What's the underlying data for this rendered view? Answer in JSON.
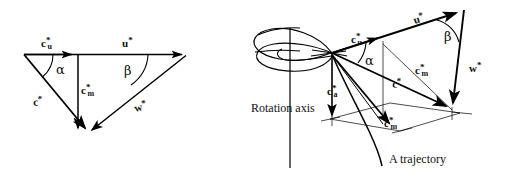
{
  "figure": {
    "background_color": "#ffffff",
    "stroke_color": "#000000"
  },
  "left_diagram": {
    "name": "planar-velocity-triangle",
    "labels": {
      "cu": {
        "base": "c",
        "sup": "*",
        "sub": "u",
        "text": "c*u"
      },
      "u": {
        "base": "u",
        "sup": "*",
        "sub": "",
        "text": "u*"
      },
      "cm": {
        "base": "c",
        "sup": "*",
        "sub": "m",
        "text": "c*m"
      },
      "c": {
        "base": "c",
        "sup": "*",
        "sub": "",
        "text": "c*"
      },
      "w": {
        "base": "w",
        "sup": "*",
        "sub": "",
        "text": "w*"
      },
      "alpha": "α",
      "beta": "β"
    }
  },
  "right_diagram": {
    "name": "three-dimensional-velocity-triangle",
    "labels": {
      "cu": {
        "base": "c",
        "sup": "*",
        "sub": "u",
        "text": "c*u"
      },
      "u": {
        "base": "u",
        "sup": "*",
        "sub": "",
        "text": "u*"
      },
      "cm_upper": {
        "base": "c",
        "sup": "*",
        "sub": "m",
        "text": "c*m"
      },
      "cm_lower": {
        "base": "c",
        "sup": "*",
        "sub": "m",
        "text": "c*m"
      },
      "ca": {
        "base": "c",
        "sup": "*",
        "sub": "a",
        "text": "c*a"
      },
      "c": {
        "base": "c",
        "sup": "*",
        "sub": "",
        "text": "c*"
      },
      "w": {
        "base": "w",
        "sup": "*",
        "sub": "",
        "text": "w*"
      },
      "alpha": "α",
      "beta": "β",
      "rotation_axis": "Rotation axis",
      "trajectory": "A trajectory"
    }
  }
}
